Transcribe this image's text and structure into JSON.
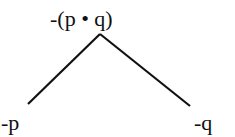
{
  "diagram": {
    "type": "truth-tree",
    "root": {
      "label": "-(p • q)"
    },
    "branches": [
      {
        "label": "-p"
      },
      {
        "label": "-q"
      }
    ],
    "line_color": "#111111"
  }
}
